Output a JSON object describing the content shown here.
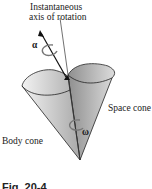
{
  "figure": {
    "labels": {
      "axis_line1": "Instantaneous",
      "axis_line2": "axis of rotation",
      "space_cone": "Space cone",
      "body_cone": "Body cone",
      "alpha": "α",
      "omega": "ω"
    },
    "caption": "Fig. 20-4",
    "colors": {
      "cone_fill_light": "#e6e6e6",
      "cone_fill_dark": "#9a9a9a",
      "outline": "#222222",
      "arrow_gray": "#777777"
    }
  }
}
